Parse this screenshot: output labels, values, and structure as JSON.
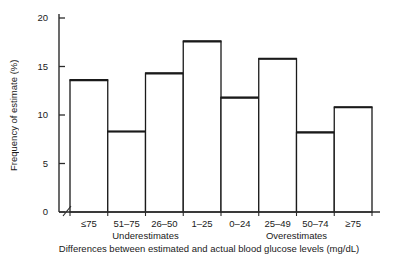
{
  "chart_data": {
    "type": "bar",
    "title": "",
    "subtitle": "",
    "xlabel": "Differences between estimated and actual blood glucose levels (mg/dL)",
    "ylabel": "Frequency of estimate (%)",
    "categories": [
      "≤75",
      "51–75",
      "26–50",
      "1–25",
      "0–24",
      "25–49",
      "50–74",
      "≥75"
    ],
    "values": [
      13.6,
      8.3,
      14.3,
      17.6,
      11.8,
      15.8,
      8.2,
      10.8
    ],
    "group_labels": [
      {
        "label": "Underestimates",
        "categories": [
          "≤75",
          "51–75",
          "26–50",
          "1–25"
        ]
      },
      {
        "label": "Overestimates",
        "categories": [
          "0–24",
          "25–49",
          "50–74",
          "≥75"
        ]
      }
    ],
    "ylim": [
      0,
      21
    ],
    "yticks": [
      0,
      5,
      10,
      15,
      20
    ],
    "ytick_labels": [
      "0",
      "5",
      "10",
      "15",
      "20"
    ],
    "grid": false,
    "legend": "none",
    "axis_break": true,
    "bar_style": {
      "fill": "#ffffff",
      "edge_color": "#1a1a1a",
      "edge_width": 1.3,
      "top_edge_width": 2.2
    }
  },
  "colors": {
    "background": "#ffffff",
    "ink": "#1a1a1a",
    "axis": "#2b2b2b"
  }
}
